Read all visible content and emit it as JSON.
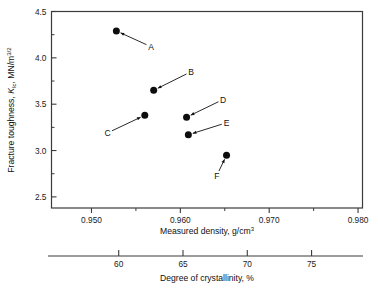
{
  "chart_data": {
    "type": "scatter",
    "title": "",
    "xlabel": "Measured density, g/cm",
    "xlabel_sup": "3",
    "xlabel_full": "Measured density, g/cm3",
    "ylabel_prefix": "Fracture toughness, ",
    "ylabel_symbol": "K",
    "ylabel_symbol_sub": "Ic",
    "ylabel_suffix": ", MN/m",
    "ylabel_sup": "3/2",
    "ylabel_full": "Fracture toughness, KIc, MN/m3/2",
    "secondary_xlabel": "Degree of crystallinity, %",
    "xlim": [
      0.9455,
      0.9805
    ],
    "ylim": [
      2.38,
      4.5
    ],
    "xticks": [
      0.95,
      0.96,
      0.97,
      0.98
    ],
    "xtick_labels": [
      "0.950",
      "0.960",
      "0.970",
      "0.980"
    ],
    "xticks_minor": [
      0.955,
      0.965,
      0.975
    ],
    "yticks": [
      2.5,
      3.0,
      3.5,
      4.0,
      4.5
    ],
    "ytick_labels": [
      "2.5",
      "3.0",
      "3.5",
      "4.0",
      "4.5"
    ],
    "yticks_minor": [
      2.75,
      3.25,
      3.75,
      4.25
    ],
    "secondary_xticks": [
      60,
      65,
      70,
      75
    ],
    "secondary_xtick_labels": [
      "60",
      "65",
      "70",
      "75"
    ],
    "secondary_xlim": [
      54.5,
      79.0
    ],
    "grid": false,
    "legend": false,
    "marker_color": "#0d0d0d",
    "axis_color": "#3b3b3b",
    "points": [
      {
        "label": "A",
        "x": 0.9528,
        "y": 4.29,
        "crystallinity": 61.4,
        "label_x": 0.9567,
        "label_y": 4.12
      },
      {
        "label": "B",
        "x": 0.957,
        "y": 3.65,
        "crystallinity": 64.3,
        "label_x": 0.9612,
        "label_y": 3.85
      },
      {
        "label": "C",
        "x": 0.956,
        "y": 3.38,
        "crystallinity": 63.6,
        "label_x": 0.9518,
        "label_y": 3.19
      },
      {
        "label": "D",
        "x": 0.9607,
        "y": 3.36,
        "crystallinity": 66.6,
        "label_x": 0.9648,
        "label_y": 3.55
      },
      {
        "label": "E",
        "x": 0.9609,
        "y": 3.17,
        "crystallinity": 66.8,
        "label_x": 0.9652,
        "label_y": 3.3
      },
      {
        "label": "F",
        "x": 0.9652,
        "y": 2.95,
        "crystallinity": 69.7,
        "label_x": 0.9641,
        "label_y": 2.73
      }
    ]
  }
}
